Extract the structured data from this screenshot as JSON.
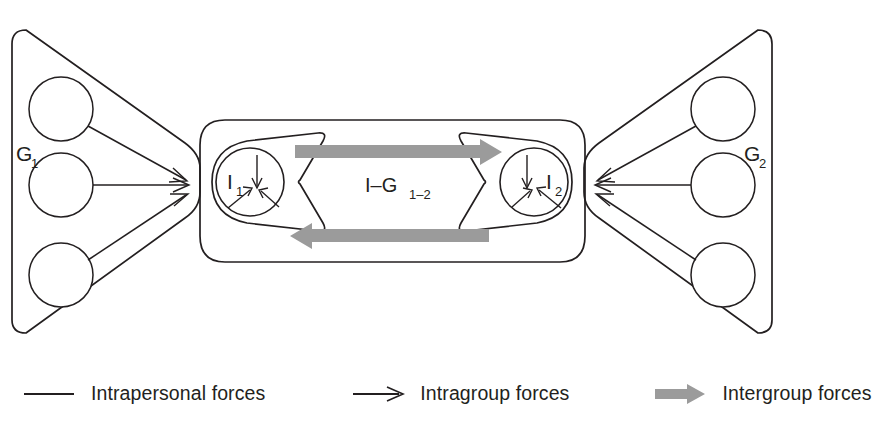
{
  "figure": {
    "groups": [
      {
        "id": "left",
        "label": "G",
        "sub": "1",
        "member_count": 3
      },
      {
        "id": "right",
        "label": "G",
        "sub": "2",
        "member_count": 3
      }
    ],
    "individuals": [
      {
        "id": "left",
        "label": "I",
        "sub": "1",
        "inward_arrows": 3
      },
      {
        "id": "right",
        "label": "I",
        "sub": "2",
        "inward_arrows": 3
      }
    ],
    "dyad": {
      "label": "I–G",
      "sub": "1–2",
      "intergroup_arrows": 2
    },
    "colors": {
      "line": "#231f20",
      "intergroup_arrow": "#9b9b9b",
      "background": "#ffffff"
    }
  },
  "legend": {
    "items": [
      {
        "icon": "plain-line-icon",
        "label": "Intrapersonal forces"
      },
      {
        "icon": "black-arrow-icon",
        "label": "Intragroup forces"
      },
      {
        "icon": "gray-arrow-icon",
        "label": "Intergroup forces"
      }
    ]
  }
}
